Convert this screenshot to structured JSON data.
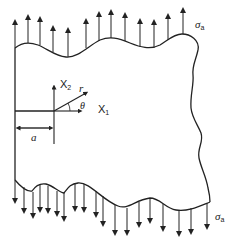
{
  "diagram": {
    "labels": {
      "stress_top": "σ",
      "stress_top_sub": "a",
      "stress_bottom": "σ",
      "stress_bottom_sub": "a",
      "axis_x2": "X",
      "axis_x2_sub": "2",
      "axis_x1": "X",
      "axis_x1_sub": "1",
      "radius": "r",
      "angle": "θ",
      "crack_length": "a"
    },
    "colors": {
      "stroke": "#222222",
      "background": "#ffffff"
    }
  }
}
